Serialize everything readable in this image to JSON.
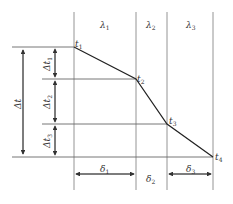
{
  "diagram": {
    "type": "multilayer-wall-temperature-profile",
    "layers": [
      {
        "symbol": "λ",
        "sub": "1",
        "thickness_symbol": "δ",
        "thickness_sub": "1"
      },
      {
        "symbol": "λ",
        "sub": "2",
        "thickness_symbol": "δ",
        "thickness_sub": "2"
      },
      {
        "symbol": "λ",
        "sub": "3",
        "thickness_symbol": "δ",
        "thickness_sub": "3"
      }
    ],
    "temperatures": [
      {
        "symbol": "t",
        "sub": "1"
      },
      {
        "symbol": "t",
        "sub": "2"
      },
      {
        "symbol": "t",
        "sub": "3"
      },
      {
        "symbol": "t",
        "sub": "4"
      }
    ],
    "deltas": [
      {
        "symbol": "Δt",
        "sub": "1"
      },
      {
        "symbol": "Δt",
        "sub": "2"
      },
      {
        "symbol": "Δt",
        "sub": "3"
      }
    ],
    "total_delta": "Δt"
  }
}
